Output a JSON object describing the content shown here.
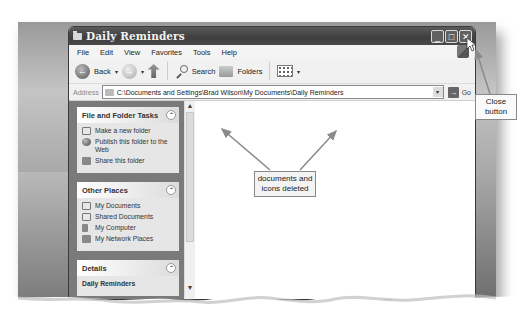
{
  "window": {
    "title": "Daily Reminders",
    "buttons": {
      "minimize": "_",
      "maximize": "□",
      "close": "✕"
    }
  },
  "menubar": {
    "items": [
      "File",
      "Edit",
      "View",
      "Favorites",
      "Tools",
      "Help"
    ]
  },
  "toolbar": {
    "back_label": "Back",
    "search_label": "Search",
    "folders_label": "Folders"
  },
  "addressbar": {
    "label": "Address",
    "value": "C:\\Documents and Settings\\Brad Wilson\\My Documents\\Daily Reminders",
    "go_label": "Go"
  },
  "taskpane": {
    "panels": [
      {
        "title": "File and Folder Tasks",
        "items": [
          "Make a new folder",
          "Publish this folder to the Web",
          "Share this folder"
        ]
      },
      {
        "title": "Other Places",
        "items": [
          "My Documents",
          "Shared Documents",
          "My Computer",
          "My Network Places"
        ]
      },
      {
        "title": "Details",
        "items": [
          "Daily Reminders"
        ]
      }
    ]
  },
  "callouts": {
    "documents": "documents and icons deleted",
    "close": "Close button"
  },
  "icons": {
    "collapse": "⌃",
    "scroll_up": "▲",
    "scroll_down": "▼",
    "go_arrow": "→",
    "back_arrow": "←",
    "forward_arrow": "→",
    "dropdown": "▾"
  }
}
